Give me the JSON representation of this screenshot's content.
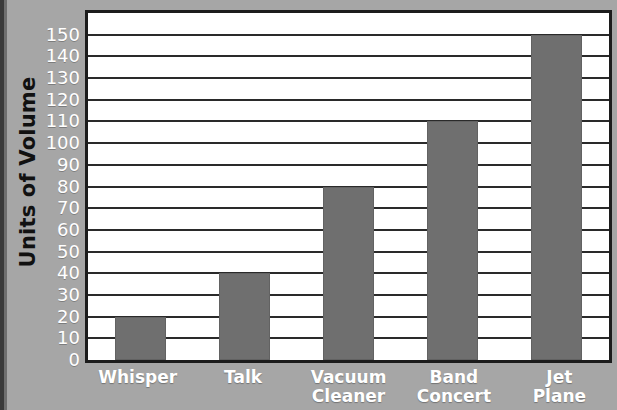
{
  "chart_data": {
    "type": "bar",
    "title": "",
    "xlabel": "",
    "ylabel": "Units of Volume",
    "categories": [
      "Whisper",
      "Talk",
      "Vacuum Cleaner",
      "Band Concert",
      "Jet Plane"
    ],
    "values": [
      20,
      40,
      80,
      110,
      150
    ],
    "ylim": [
      0,
      160
    ],
    "ytick_step": 10,
    "yticks": [
      0,
      10,
      20,
      30,
      40,
      50,
      60,
      70,
      80,
      90,
      100,
      110,
      120,
      130,
      140,
      150
    ],
    "ytick_labels": [
      "0",
      "10",
      "20",
      "30",
      "40",
      "50",
      "60",
      "70",
      "80",
      "90",
      "100",
      "110",
      "120",
      "130",
      "140",
      "150"
    ],
    "grid": true,
    "grid_axis": "y",
    "legend": null,
    "bar_color": "#6f6f6f",
    "plot_background": "#ffffff",
    "axis_color": "#1c1c1c",
    "figure_background": "#a8a8a8",
    "tick_label_color": "#ffffff",
    "axis_title_color": "#111111"
  },
  "axis": {
    "y_title": "Units of Volume"
  },
  "categories": [
    {
      "label": "Whisper",
      "lines": [
        "Whisper"
      ],
      "value": 20
    },
    {
      "label": "Talk",
      "lines": [
        "Talk"
      ],
      "value": 40
    },
    {
      "label": "Vacuum Cleaner",
      "lines": [
        "Vacuum",
        "Cleaner"
      ],
      "value": 80
    },
    {
      "label": "Band Concert",
      "lines": [
        "Band",
        "Concert"
      ],
      "value": 110
    },
    {
      "label": "Jet Plane",
      "lines": [
        "Jet",
        "Plane"
      ],
      "value": 150
    }
  ]
}
